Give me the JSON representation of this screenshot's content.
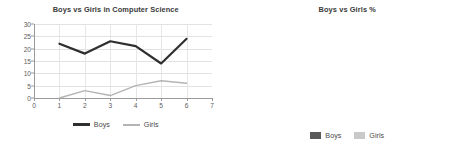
{
  "colors": {
    "boys": "#595959",
    "girls": "#c9c9c9",
    "axis": "#9a9a9a",
    "grid": "#e2e2e2",
    "text": "#5d5d5d",
    "title": "#3a3a3a",
    "background": "#ffffff"
  },
  "left_panel": {
    "legend": {
      "boys_label": "Boys",
      "girls_label": "Girls"
    }
  },
  "right_panel": {
    "legend": {
      "boys_label": "Boys",
      "girls_label": "Girls"
    }
  },
  "chart_data": [
    {
      "type": "line",
      "title": "Boys vs Girls in Computer Science",
      "xlabel": "",
      "ylabel": "",
      "x": [
        1,
        2,
        3,
        4,
        5,
        6
      ],
      "xlim": [
        0,
        7
      ],
      "ylim": [
        0,
        30
      ],
      "xticks": [
        "0",
        "1",
        "2",
        "3",
        "4",
        "5",
        "6",
        "7"
      ],
      "yticks": [
        "0",
        "5",
        "10",
        "15",
        "20",
        "25",
        "30"
      ],
      "grid": true,
      "legend_position": "bottom",
      "series": [
        {
          "name": "Boys",
          "values": [
            22,
            18,
            23,
            21,
            14,
            24
          ],
          "color": "#2f2f2f",
          "width": 2.2
        },
        {
          "name": "Girls",
          "values": [
            0,
            3,
            1,
            5,
            7,
            6
          ],
          "color": "#b4b4b4",
          "width": 1.4
        }
      ]
    },
    {
      "type": "bar",
      "subtype": "stacked-100",
      "title": "Boys vs Girls %",
      "xlabel": "",
      "ylabel": "",
      "categories": [
        "2018/19",
        "2019/20",
        "2020/21",
        "2021/22",
        "2022/23",
        "2023/24"
      ],
      "ylim": [
        0,
        120
      ],
      "yticks": [
        "0.00%",
        "20.00%",
        "40.00%",
        "60.00%",
        "80.00%",
        "100.00%",
        "120.00%"
      ],
      "grid": true,
      "legend_position": "bottom",
      "series": [
        {
          "name": "Boys",
          "values": [
            100,
            86,
            96,
            84,
            66,
            80
          ],
          "color": "#595959"
        },
        {
          "name": "Girls",
          "values": [
            0,
            14,
            4,
            16,
            34,
            20
          ],
          "color": "#c9c9c9"
        }
      ]
    }
  ]
}
